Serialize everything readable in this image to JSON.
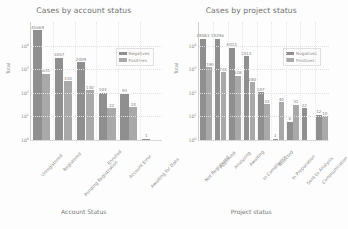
{
  "charts": [
    {
      "id": "account-status",
      "title": "Cases by account status",
      "xlabel": "Account Status",
      "ylabel": "Total",
      "legend": {
        "negatives": "Negatives",
        "positives": "Positives"
      },
      "yticks": [
        "10",
        "10",
        "10",
        "10",
        "10"
      ],
      "yexps": [
        "0",
        "1",
        "2",
        "3",
        "4"
      ]
    },
    {
      "id": "project-status",
      "title": "Cases by project status",
      "xlabel": "Project status",
      "ylabel": "Total",
      "legend": {
        "negatives": "Negatives",
        "positives": "Positives"
      },
      "yticks": [
        "10",
        "10",
        "10",
        "10",
        "10"
      ],
      "yexps": [
        "0",
        "1",
        "2",
        "3",
        "4"
      ]
    }
  ],
  "chart_data": [
    {
      "type": "bar",
      "id": "account-status",
      "title": "Cases by account status",
      "xlabel": "Account Status",
      "ylabel": "Total",
      "yscale": "log",
      "ylim": [
        1,
        100000
      ],
      "grid": true,
      "legend_position": "upper right",
      "categories": [
        "Unregistered",
        "Registered",
        "Pending Registration",
        "Enrolled",
        "Account Error",
        "Awaiting for Data"
      ],
      "series": [
        {
          "name": "Negatives",
          "color": "#8f8f8f",
          "values": [
            45669,
            3057,
            2009,
            103,
            93,
            1
          ]
        },
        {
          "name": "Positives",
          "color": "#a9a9a9",
          "values": [
            631,
            310,
            130,
            22,
            24,
            null
          ]
        }
      ]
    },
    {
      "type": "bar",
      "id": "project-status",
      "title": "Cases by project status",
      "xlabel": "Project status",
      "ylabel": "Total",
      "yscale": "log",
      "ylim": [
        1,
        100000
      ],
      "grid": true,
      "legend_position": "upper right",
      "categories": [
        "Not Registered",
        "Approved",
        "Analyzing",
        "Awaiting",
        "In Compliance",
        "Rejected",
        "In Preparation",
        "Sent to Analysis",
        "Communication"
      ],
      "series": [
        {
          "name": "Negatives",
          "color": "#8f8f8f",
          "values": [
            19083,
            19296,
            8013,
            3513,
            107,
            1,
            6,
            22,
            12
          ]
        },
        {
          "name": "Positives",
          "color": "#a9a9a9",
          "values": [
            1190,
            735,
            528,
            280,
            33,
            40,
            31,
            null,
            10
          ]
        }
      ],
      "extra_values": {
        "last_negative": 10
      }
    }
  ]
}
